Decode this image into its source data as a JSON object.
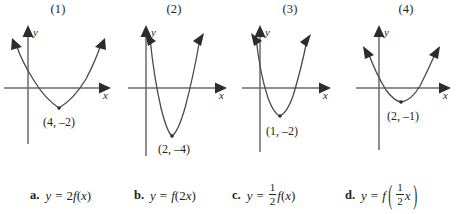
{
  "figure": {
    "cut_off_header_text": "",
    "panels": [
      {
        "label": "(1)",
        "x_axis_label": "x",
        "y_axis_label": "y",
        "vertex_label": "(4, –2)",
        "vertex": {
          "x": 4,
          "y": -2
        },
        "shape": "wide parabola opening upward"
      },
      {
        "label": "(2)",
        "x_axis_label": "x",
        "y_axis_label": "y",
        "vertex_label": "(2, –4)",
        "vertex": {
          "x": 2,
          "y": -4
        },
        "shape": "narrow deep parabola opening upward"
      },
      {
        "label": "(3)",
        "x_axis_label": "x",
        "y_axis_label": "y",
        "vertex_label": "(1, –2)",
        "vertex": {
          "x": 1,
          "y": -2
        },
        "shape": "narrow parabola opening upward"
      },
      {
        "label": "(4)",
        "x_axis_label": "x",
        "y_axis_label": "y",
        "vertex_label": "(2, –1)",
        "vertex": {
          "x": 2,
          "y": -1
        },
        "shape": "wide shallow parabola opening upward"
      }
    ]
  },
  "answers": [
    {
      "tag": "a.",
      "lhs": "y",
      "equals": "=",
      "coefficient": "2",
      "fn": "f",
      "open": "(",
      "arg": "x",
      "close": ")",
      "plain": "y = 2f(x)"
    },
    {
      "tag": "b.",
      "lhs": "y",
      "equals": "=",
      "fn": "f",
      "open": "(",
      "arg_coefficient": "2",
      "arg": "x",
      "close": ")",
      "plain": "y = f(2x)"
    },
    {
      "tag": "c.",
      "lhs": "y",
      "equals": "=",
      "frac_numerator": "1",
      "frac_denominator": "2",
      "fn": "f",
      "open": "(",
      "arg": "x",
      "close": ")",
      "plain": "y = 1/2 f(x)"
    },
    {
      "tag": "d.",
      "lhs": "y",
      "equals": "=",
      "fn": "f",
      "open": "(",
      "frac_numerator": "1",
      "frac_denominator": "2",
      "arg": "x",
      "close": ")",
      "plain": "y = f(1/2 x)"
    }
  ],
  "style": {
    "ink": "#231f20",
    "axis": "#5a5a5a",
    "curve": "#3a3a3a",
    "background": "#ffffff"
  }
}
